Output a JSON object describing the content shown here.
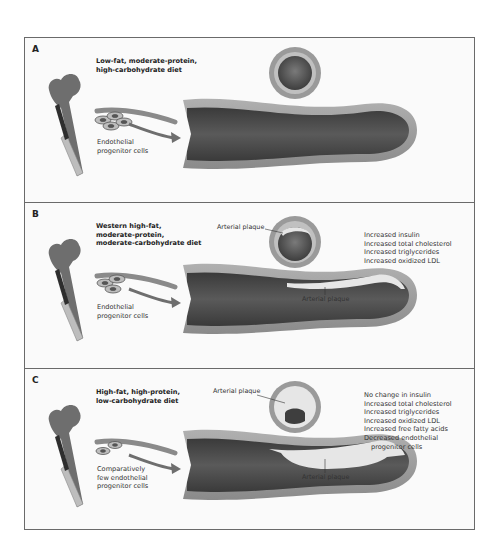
{
  "figure": {
    "panels": [
      {
        "letter": "A",
        "diet": [
          "Low-fat, moderate-protein,",
          "high-carbohydrate diet"
        ],
        "cells_label": [
          "Endothelial",
          "progenitor cells"
        ],
        "plaque_labels": [],
        "effects": []
      },
      {
        "letter": "B",
        "diet": [
          "Western high-fat,",
          "moderate-protein,",
          "moderate-carbohydrate diet"
        ],
        "cells_label": [
          "Endothelial",
          "progenitor cells"
        ],
        "plaque_labels": {
          "cross_section": "Arterial plaque",
          "vessel": "Arterial plaque"
        },
        "effects": [
          "Increased insulin",
          "Increased total cholesterol",
          "Increased triglycerides",
          "Increased oxidized LDL"
        ]
      },
      {
        "letter": "C",
        "diet": [
          "High-fat, high-protein,",
          "low-carbohydrate diet"
        ],
        "cells_label": [
          "Comparatively",
          "few endothelial",
          "progenitor cells"
        ],
        "plaque_labels": {
          "cross_section": "Arterial plaque",
          "vessel": "Arterial plaque"
        },
        "effects": [
          "No change in insulin",
          "Increased total cholesterol",
          "Increased triglycerides",
          "Increased oxidized LDL",
          "Increased free fatty acids",
          "Decreased endothelial",
          "progenitor cells"
        ]
      }
    ],
    "colors": {
      "vessel_wall": "#9a9a9a",
      "vessel_lumen": "#4a4a4a",
      "plaque": "#e6e6e6",
      "bone": "#6e6e6e",
      "frame": "#6a6a6a"
    }
  }
}
